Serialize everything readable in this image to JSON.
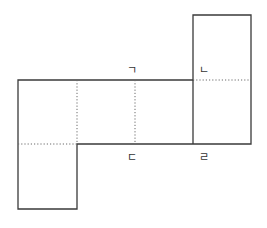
{
  "diagram": {
    "type": "cube-net",
    "labels": [
      {
        "id": "giyeok",
        "text": "ㄱ",
        "x": 131,
        "y": 74
      },
      {
        "id": "nieun",
        "text": "ㄴ",
        "x": 203,
        "y": 74
      },
      {
        "id": "digeut",
        "text": "ㄷ",
        "x": 131,
        "y": 160
      },
      {
        "id": "rieul",
        "text": "ㄹ",
        "x": 203,
        "y": 160
      }
    ],
    "colors": {
      "line": "#3a3a3a",
      "fold": "#6a6a6a",
      "background": "#ffffff"
    }
  }
}
